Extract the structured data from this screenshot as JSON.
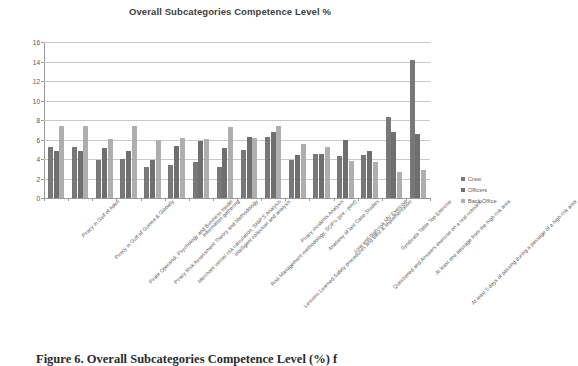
{
  "chart_data": {
    "type": "bar",
    "title": "Overall Subcategories Competence Level %",
    "xlabel": "",
    "ylabel": "",
    "ylim": [
      0,
      16
    ],
    "ytick_step": 2,
    "yticks": [
      0,
      2,
      4,
      6,
      8,
      10,
      12,
      14,
      16
    ],
    "grid": true,
    "legend_position": "right",
    "categories": [
      "Piracy in Gulf of Aden",
      "Piracy in Gulf of Guinea & Globally",
      "Pirate Operandi, Psychology and Business model",
      "Piracy Risk Assessment Theory and Methodology",
      "Merchant vessel risk calculation, SHIP'S Analysis",
      "Information gathering",
      "Intelligent collection and analysis",
      "Risk Management methodology, SOP's (pre - post)",
      "Lessons Learned Safety procedures and Best & Implementation",
      "Piracy incidents Analysis",
      "Anatomy of last Case Studies",
      "Low and high risk MV Exercise",
      "Questioned and Answers exercise on a real scenario",
      "Syndicate Table Top Exercise",
      "At least one passage from the high risk area",
      "At least 5 days of passing during a passage of a high risk area"
    ],
    "series": [
      {
        "name": "Crew",
        "color": "#787878",
        "values": [
          5.2,
          5.2,
          3.9,
          4.0,
          3.2,
          3.35,
          3.65,
          3.2,
          4.95,
          6.3,
          3.95,
          4.5,
          4.3,
          4.4,
          8.3,
          5.6
        ]
      },
      {
        "name": "Officers",
        "color": "#6f6f6f",
        "values": [
          4.85,
          4.85,
          5.1,
          4.8,
          3.85,
          5.35,
          5.85,
          5.1,
          6.25,
          6.8,
          4.4,
          4.5,
          5.9,
          4.85,
          6.75,
          6.6
        ]
      },
      {
        "name": "Back Office",
        "color": "#aeaeae",
        "values": [
          7.35,
          7.4,
          6.1,
          7.35,
          5.95,
          6.15,
          6.1,
          7.3,
          6.2,
          7.4,
          5.5,
          5.25,
          3.8,
          3.7,
          2.7,
          2.85
        ]
      }
    ],
    "outlier_note": {
      "category_index": 15,
      "series": "Crew",
      "value": 14.15
    }
  },
  "legend": {
    "items": [
      {
        "label": "Crew",
        "marker": "square-swatch-icon"
      },
      {
        "label": "Officers",
        "marker": "square-swatch-icon"
      },
      {
        "label": "Back Office",
        "marker": "square-swatch-icon"
      }
    ]
  },
  "caption": {
    "prefix": "Figure 6.",
    "text": "Overall Subcategories Competence Level (%) f"
  }
}
